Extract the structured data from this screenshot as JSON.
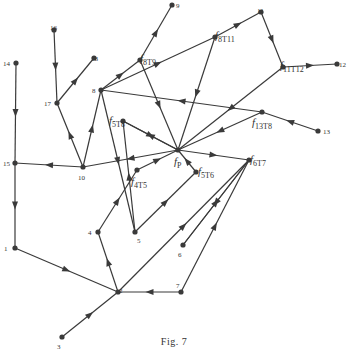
{
  "figure": {
    "caption": "Fig. 7",
    "ink_color": "#3a3a3a",
    "background": "#ffffff"
  },
  "nodes": [
    {
      "id": "1",
      "label": "1",
      "x": 15,
      "y": 248,
      "lx": 4,
      "ly": 251
    },
    {
      "id": "2",
      "label": "2",
      "x": 118,
      "y": 292,
      "lx": 119,
      "ly": 293
    },
    {
      "id": "3",
      "label": "3",
      "x": 62,
      "y": 337,
      "lx": 57,
      "ly": 349
    },
    {
      "id": "4",
      "label": "4",
      "x": 98,
      "y": 232,
      "lx": 88,
      "ly": 235
    },
    {
      "id": "5",
      "label": "5",
      "x": 135,
      "y": 232,
      "lx": 137,
      "ly": 243
    },
    {
      "id": "6",
      "label": "6",
      "x": 183,
      "y": 245,
      "lx": 178,
      "ly": 257
    },
    {
      "id": "7",
      "label": "7",
      "x": 181,
      "y": 292,
      "lx": 176,
      "ly": 288
    },
    {
      "id": "8",
      "label": "8",
      "x": 101,
      "y": 90,
      "lx": 92,
      "ly": 93
    },
    {
      "id": "9",
      "label": "9",
      "x": 172,
      "y": 5,
      "lx": 176,
      "ly": 8
    },
    {
      "id": "10",
      "label": "10",
      "x": 83,
      "y": 167,
      "lx": 78,
      "ly": 180
    },
    {
      "id": "11",
      "label": "11",
      "x": 261,
      "y": 12,
      "lx": 257,
      "ly": 13
    },
    {
      "id": "12",
      "label": "12",
      "x": 337,
      "y": 64,
      "lx": 339,
      "ly": 67
    },
    {
      "id": "13",
      "label": "13",
      "x": 318,
      "y": 131,
      "lx": 323,
      "ly": 134
    },
    {
      "id": "14",
      "label": "14",
      "x": 16,
      "y": 63,
      "lx": 3,
      "ly": 66
    },
    {
      "id": "15",
      "label": "15",
      "x": 15,
      "y": 163,
      "lx": 3,
      "ly": 166
    },
    {
      "id": "16",
      "label": "16",
      "x": 54,
      "y": 30,
      "lx": 50,
      "ly": 30
    },
    {
      "id": "17",
      "label": "17",
      "x": 57,
      "y": 103,
      "lx": 44,
      "ly": 106
    },
    {
      "id": "18",
      "label": "18",
      "x": 94,
      "y": 58,
      "lx": 91,
      "ly": 61
    },
    {
      "id": "fp",
      "label": "f",
      "sub": "P",
      "x": 178,
      "y": 150,
      "lx": 174,
      "ly": 165
    },
    {
      "id": "f8T9",
      "label": "f",
      "sub": "8T9",
      "x": 140,
      "y": 60,
      "lx": 140,
      "ly": 62
    },
    {
      "id": "f8T11",
      "label": "f",
      "sub": "8T11",
      "x": 215,
      "y": 37,
      "lx": 215,
      "ly": 39
    },
    {
      "id": "f11T12",
      "label": "f",
      "sub": "11T12",
      "x": 283,
      "y": 67,
      "lx": 280,
      "ly": 69
    },
    {
      "id": "f13T8",
      "label": "f",
      "sub": "13T8",
      "x": 262,
      "y": 112,
      "lx": 252,
      "ly": 126
    },
    {
      "id": "f6T7",
      "label": "f",
      "sub": "6T7",
      "x": 249,
      "y": 160,
      "lx": 250,
      "ly": 163
    },
    {
      "id": "f5T6",
      "label": "f",
      "sub": "5T6",
      "x": 196,
      "y": 172,
      "lx": 198,
      "ly": 175
    },
    {
      "id": "f4T5",
      "label": "f",
      "sub": "4T5",
      "x": 137,
      "y": 170,
      "lx": 131,
      "ly": 185
    },
    {
      "id": "f5T8",
      "label": "f",
      "sub": "5T8",
      "x": 123,
      "y": 121,
      "lx": 109,
      "ly": 124
    }
  ],
  "edges": [
    {
      "from": "14",
      "to": "15"
    },
    {
      "from": "15",
      "to": "1"
    },
    {
      "from": "1",
      "to": "2"
    },
    {
      "from": "3",
      "to": "2"
    },
    {
      "from": "2",
      "to": "4"
    },
    {
      "from": "4",
      "to": "f4T5"
    },
    {
      "from": "7",
      "to": "2"
    },
    {
      "from": "2",
      "to": "f6T7"
    },
    {
      "from": "f6T7",
      "to": "6"
    },
    {
      "from": "5",
      "to": "f5T6"
    },
    {
      "from": "f5T6",
      "to": "fp"
    },
    {
      "from": "f4T5",
      "to": "fp"
    },
    {
      "from": "5",
      "to": "f5T8"
    },
    {
      "from": "8",
      "to": "5"
    },
    {
      "from": "f5T8",
      "to": "fp"
    },
    {
      "from": "10",
      "to": "15"
    },
    {
      "from": "10",
      "to": "17"
    },
    {
      "from": "16",
      "to": "17"
    },
    {
      "from": "17",
      "to": "18"
    },
    {
      "from": "10",
      "to": "8"
    },
    {
      "from": "8",
      "to": "f8T9"
    },
    {
      "from": "f8T9",
      "to": "9"
    },
    {
      "from": "f8T9",
      "to": "fp"
    },
    {
      "from": "8",
      "to": "f8T11"
    },
    {
      "from": "f8T11",
      "to": "11"
    },
    {
      "from": "f8T11",
      "to": "fp"
    },
    {
      "from": "11",
      "to": "f11T12"
    },
    {
      "from": "f11T12",
      "to": "12"
    },
    {
      "from": "f11T12",
      "to": "fp"
    },
    {
      "from": "13",
      "to": "f13T8"
    },
    {
      "from": "f13T8",
      "to": "8"
    },
    {
      "from": "f13T8",
      "to": "fp"
    },
    {
      "from": "fp",
      "to": "f6T7"
    },
    {
      "from": "fp",
      "to": "10"
    },
    {
      "from": "fp",
      "to": "f5T8"
    },
    {
      "from": "6",
      "to": "f6T7"
    },
    {
      "from": "7",
      "to": "f6T7"
    }
  ]
}
